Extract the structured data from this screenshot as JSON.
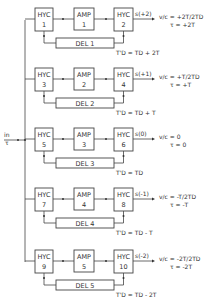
{
  "input": {
    "line1": "in",
    "line2": "τ"
  },
  "rows": [
    {
      "hyc_in": {
        "name": "HYC",
        "num": "1"
      },
      "amp": {
        "name": "AMP",
        "num": "1"
      },
      "hyc_out": {
        "name": "HYC",
        "num": "2"
      },
      "delay": "DEL 1",
      "delay_eq": "T'D = TD + 2T",
      "output": "s(+2)",
      "ratio": "v/c = +2T/2TD",
      "tau": "τ = +2T"
    },
    {
      "hyc_in": {
        "name": "HYC",
        "num": "3"
      },
      "amp": {
        "name": "AMP",
        "num": "2"
      },
      "hyc_out": {
        "name": "HYC",
        "num": "4"
      },
      "delay": "DEL 2",
      "delay_eq": "T'D = TD + T",
      "output": "s(+1)",
      "ratio": "v/c = +T/2TD",
      "tau": "τ = +T"
    },
    {
      "hyc_in": {
        "name": "HYC",
        "num": "5"
      },
      "amp": {
        "name": "AMP",
        "num": "3"
      },
      "hyc_out": {
        "name": "HYC",
        "num": "6"
      },
      "delay": "DEL 3",
      "delay_eq": "T'D = TD",
      "output": "s(0)",
      "ratio": "v/c = 0",
      "tau": "τ = 0"
    },
    {
      "hyc_in": {
        "name": "HYC",
        "num": "7"
      },
      "amp": {
        "name": "AMP",
        "num": "4"
      },
      "hyc_out": {
        "name": "HYC",
        "num": "8"
      },
      "delay": "DEL 4",
      "delay_eq": "T'D = TD - T",
      "output": "s(-1)",
      "ratio": "v/c = -T/2TD",
      "tau": "τ = -T"
    },
    {
      "hyc_in": {
        "name": "HYC",
        "num": "9"
      },
      "amp": {
        "name": "AMP",
        "num": "5"
      },
      "hyc_out": {
        "name": "HYC",
        "num": "10"
      },
      "delay": "DEL 5",
      "delay_eq": "T'D = TD - 2T",
      "output": "s(-2)",
      "ratio": "v/c = -2T/2TD",
      "tau": "τ = -2T"
    }
  ]
}
